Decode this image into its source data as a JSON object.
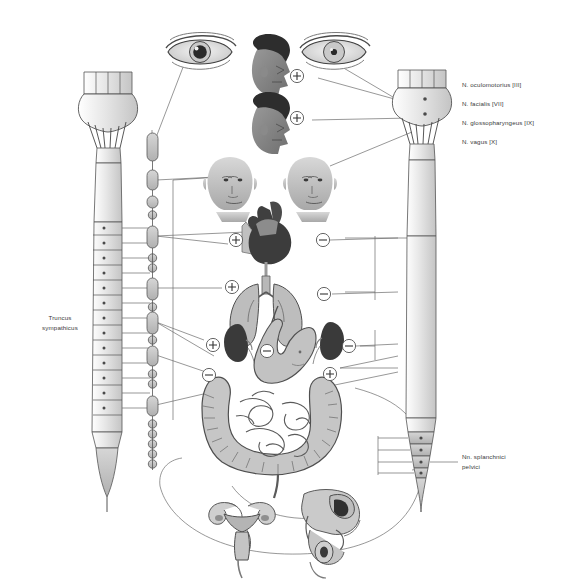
{
  "figure": {
    "background_color": "#ffffff",
    "line_color": "#6b6b6b",
    "organ_fill_light": "#d3d3d3",
    "organ_fill_mid": "#9a9a9a",
    "organ_fill_dark": "#4d4d4d",
    "text_color": "#3a3a3a"
  },
  "nerve_labels": [
    {
      "text": "N. oculomotorius [III]"
    },
    {
      "text": "N. facialis [VII]"
    },
    {
      "text": "N. glossopharyngeus [IX]"
    },
    {
      "text": "N. vagus [X]"
    }
  ],
  "left_label": {
    "text": "Truncus\nsympathicus"
  },
  "pelvic_label": {
    "text": "Nn. splanchnici\npelvici"
  },
  "footer": {
    "text": ""
  },
  "symbols": {
    "excitatory": "+",
    "inhibitory": "−",
    "markers": [
      {
        "name": "eye-sympathetic",
        "sign": "+",
        "x": 297,
        "y": 76
      },
      {
        "name": "lacrimal-sympathetic",
        "sign": "+",
        "x": 297,
        "y": 118
      },
      {
        "name": "heart-sympathetic",
        "sign": "+",
        "x": 236,
        "y": 240
      },
      {
        "name": "heart-parasympathetic",
        "sign": "−",
        "x": 323,
        "y": 240
      },
      {
        "name": "lung-sympathetic",
        "sign": "+",
        "x": 232,
        "y": 287
      },
      {
        "name": "lung-parasympathetic",
        "sign": "−",
        "x": 324,
        "y": 294
      },
      {
        "name": "stomach-sympathetic",
        "sign": "+",
        "x": 213,
        "y": 345
      },
      {
        "name": "stomach-parasympathetic",
        "sign": "−",
        "x": 267,
        "y": 351
      },
      {
        "name": "kidney-parasympathetic",
        "sign": "−",
        "x": 349,
        "y": 346
      },
      {
        "name": "intestine-sympathetic",
        "sign": "−",
        "x": 209,
        "y": 375
      },
      {
        "name": "intestine-parasympathetic",
        "sign": "+",
        "x": 330,
        "y": 374
      }
    ]
  },
  "organs": [
    {
      "name": "eye-dilated-pupil",
      "side": "left",
      "system": "sympathetic"
    },
    {
      "name": "eye-constricted-pupil",
      "side": "right",
      "system": "parasympathetic"
    },
    {
      "name": "head-profile-upper",
      "system": "sympathetic"
    },
    {
      "name": "head-profile-lower",
      "system": "sympathetic"
    },
    {
      "name": "face-frontal-left",
      "system": "sympathetic"
    },
    {
      "name": "face-frontal-right",
      "system": "parasympathetic"
    },
    {
      "name": "heart",
      "system": "both"
    },
    {
      "name": "lungs",
      "system": "both"
    },
    {
      "name": "kidney-left",
      "system": "sympathetic"
    },
    {
      "name": "kidney-right",
      "system": "sympathetic"
    },
    {
      "name": "stomach",
      "system": "both"
    },
    {
      "name": "intestines",
      "system": "both"
    },
    {
      "name": "uterus-ovaries",
      "system": "parasympathetic"
    },
    {
      "name": "male-pelvic-organs",
      "system": "parasympathetic"
    }
  ],
  "structures": [
    {
      "name": "brainstem-left",
      "label": ""
    },
    {
      "name": "spinal-cord-left",
      "label": ""
    },
    {
      "name": "sympathetic-trunk",
      "label": "Truncus sympathicus"
    },
    {
      "name": "brainstem-right",
      "label": ""
    },
    {
      "name": "spinal-cord-right",
      "label": ""
    },
    {
      "name": "vagus-trunk",
      "label": "N. vagus [X]"
    }
  ]
}
